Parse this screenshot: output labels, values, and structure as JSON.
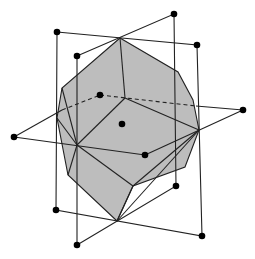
{
  "diagram": {
    "width": 255,
    "height": 259,
    "colors": {
      "background": "#ffffff",
      "solid_fill": "#bdbdbd",
      "edge": "#222222",
      "dot": "#000000"
    },
    "polyhedron": {
      "outline": [
        [
          120,
          38
        ],
        [
          178,
          72
        ],
        [
          193,
          100
        ],
        [
          199,
          130
        ],
        [
          185,
          167
        ],
        [
          133,
          186
        ],
        [
          117,
          221
        ],
        [
          68,
          175
        ],
        [
          57,
          118
        ],
        [
          62,
          88
        ]
      ],
      "edges": [
        [
          [
            120,
            38
          ],
          [
            125,
            98
          ]
        ],
        [
          [
            125,
            98
          ],
          [
            77,
            145
          ]
        ],
        [
          [
            125,
            98
          ],
          [
            199,
            130
          ]
        ],
        [
          [
            62,
            88
          ],
          [
            77,
            145
          ]
        ],
        [
          [
            57,
            118
          ],
          [
            77,
            145
          ]
        ],
        [
          [
            77,
            145
          ],
          [
            133,
            186
          ]
        ],
        [
          [
            77,
            145
          ],
          [
            68,
            175
          ]
        ],
        [
          [
            199,
            130
          ],
          [
            133,
            186
          ]
        ],
        [
          [
            133,
            186
          ],
          [
            117,
            221
          ]
        ],
        [
          [
            199,
            130
          ],
          [
            117,
            221
          ]
        ]
      ]
    },
    "rectangles": [
      {
        "name": "vertical-rect-1",
        "points": [
          [
            57,
            32
          ],
          [
            197,
            45
          ],
          [
            202,
            236
          ],
          [
            56,
            210
          ]
        ]
      },
      {
        "name": "vertical-rect-2",
        "points": [
          [
            77,
            56
          ],
          [
            174,
            14
          ],
          [
            176,
            186
          ],
          [
            77,
            245
          ]
        ]
      }
    ],
    "horizontal_rect": {
      "solid_edges": [
        [
          [
            14,
            137
          ],
          [
            62,
            110
          ]
        ],
        [
          [
            196,
            106
          ],
          [
            243,
            110
          ]
        ],
        [
          [
            243,
            110
          ],
          [
            145,
            155
          ]
        ],
        [
          [
            145,
            155
          ],
          [
            14,
            137
          ]
        ]
      ],
      "dashed_edges": [
        [
          [
            62,
            110
          ],
          [
            100,
            95
          ]
        ],
        [
          [
            100,
            95
          ],
          [
            196,
            106
          ]
        ]
      ]
    },
    "dots": [
      [
        57,
        32
      ],
      [
        77,
        56
      ],
      [
        174,
        14
      ],
      [
        197,
        45
      ],
      [
        100,
        95
      ],
      [
        122,
        124
      ],
      [
        14,
        137
      ],
      [
        243,
        110
      ],
      [
        145,
        155
      ],
      [
        176,
        186
      ],
      [
        56,
        210
      ],
      [
        77,
        245
      ],
      [
        202,
        236
      ]
    ],
    "center_dot": [
      122,
      124
    ]
  }
}
